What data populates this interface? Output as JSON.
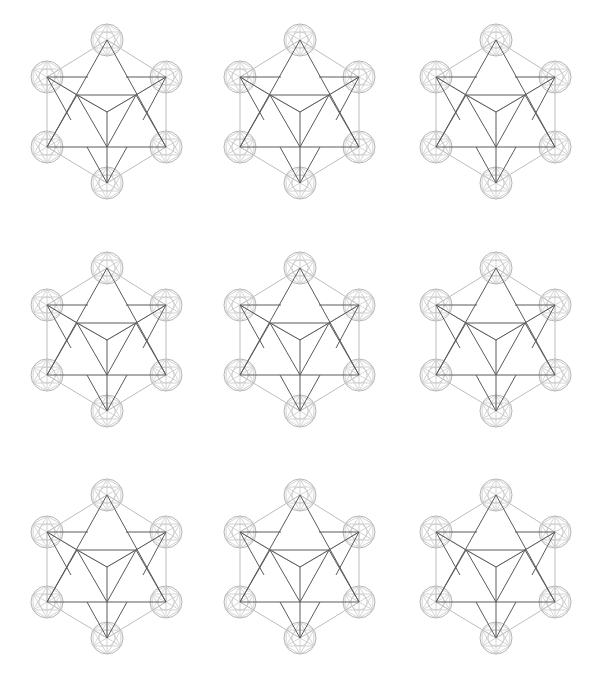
{
  "page": {
    "background": "#ffffff",
    "width": 597,
    "height": 688
  },
  "colors": {
    "dark_line": "#5a5a5a",
    "light_line": "#bdbdbd",
    "node_circle": "#b5b5b5"
  },
  "grid": {
    "rows": 3,
    "cols": 3,
    "col_offsets": [
      0,
      193,
      389
    ],
    "row_offsets": [
      0,
      228,
      455
    ]
  },
  "figure": {
    "name": "star-tetrahedron-metatron-cube",
    "node_radius": 16,
    "nodes": {
      "top": [
        107,
        40
      ],
      "upper_left": [
        47,
        77
      ],
      "upper_right": [
        166,
        77
      ],
      "lower_left": [
        47,
        147
      ],
      "lower_right": [
        166,
        147
      ],
      "bottom": [
        107,
        183
      ]
    },
    "inner_points": {
      "inner_left": [
        77,
        95
      ],
      "inner_right": [
        136,
        95
      ],
      "center": [
        107,
        112
      ],
      "lower_center": [
        107,
        147
      ]
    }
  },
  "figures": [
    {
      "id": "figure-1",
      "row": 0,
      "col": 0
    },
    {
      "id": "figure-2",
      "row": 0,
      "col": 1
    },
    {
      "id": "figure-3",
      "row": 0,
      "col": 2
    },
    {
      "id": "figure-4",
      "row": 1,
      "col": 0
    },
    {
      "id": "figure-5",
      "row": 1,
      "col": 1
    },
    {
      "id": "figure-6",
      "row": 1,
      "col": 2
    },
    {
      "id": "figure-7",
      "row": 2,
      "col": 0
    },
    {
      "id": "figure-8",
      "row": 2,
      "col": 1
    },
    {
      "id": "figure-9",
      "row": 2,
      "col": 2
    }
  ]
}
